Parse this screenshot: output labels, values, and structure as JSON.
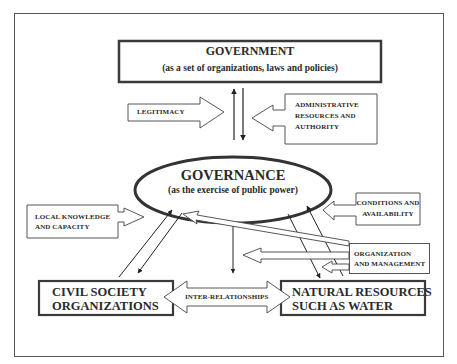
{
  "diagram": {
    "government": {
      "title": "GOVERNMENT",
      "subtitle": "(as a set of organizations, laws and policies)"
    },
    "governance": {
      "title": "GOVERNANCE",
      "subtitle": "(as the exercise of public power)"
    },
    "arrows": {
      "legitimacy": "LEGITIMACY",
      "administrative": [
        "ADMINISTRATIVE",
        "RESOURCES AND",
        "AUTHORITY"
      ],
      "local_knowledge": [
        "LOCAL KNOWLEDGE",
        "AND CAPACITY"
      ],
      "conditions": [
        "CONDITIONS AND",
        "AVAILABILITY"
      ],
      "organization": [
        "ORGANIZATION",
        "AND MANAGEMENT"
      ],
      "inter_relationships": "INTER-RELATIONSHIPS"
    },
    "civil_society": [
      "CIVIL SOCIETY",
      "ORGANIZATIONS"
    ],
    "natural_resources": [
      "NATURAL RESOURCES",
      "SUCH AS WATER"
    ],
    "colors": {
      "stroke": "#2a2a2a",
      "thick_border": "#3a3a3a",
      "background": "#ffffff"
    }
  }
}
